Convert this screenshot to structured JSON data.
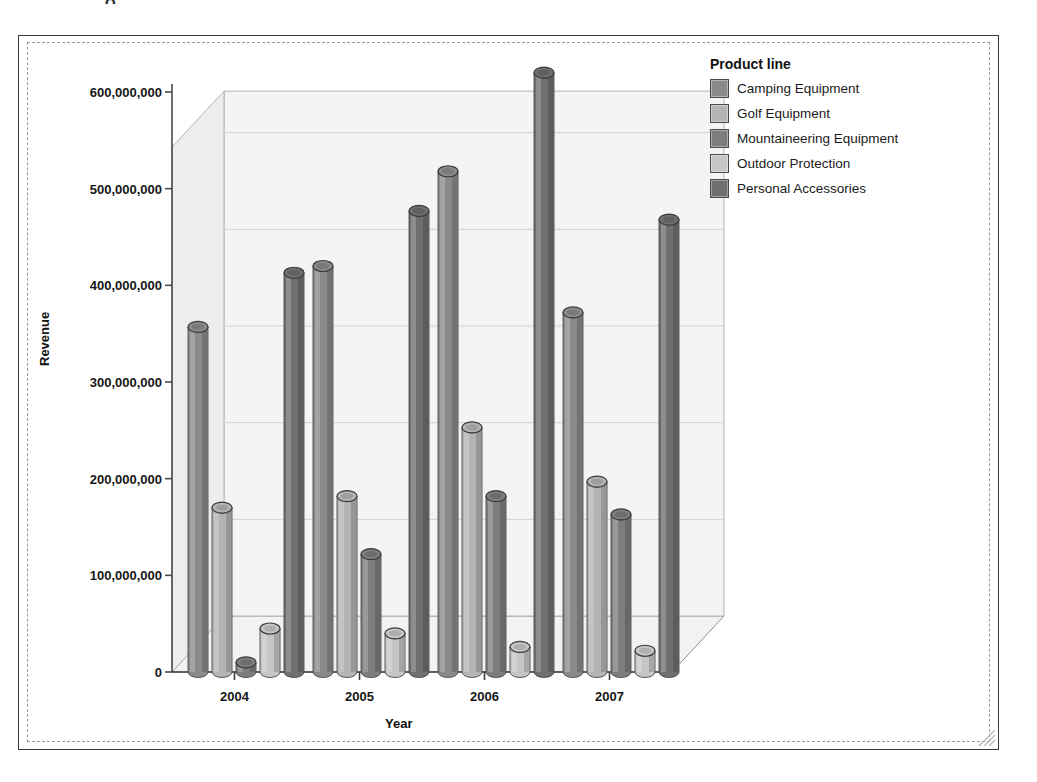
{
  "window": {
    "resize_grip": "resize-grip",
    "top_remnant": "g"
  },
  "legend": {
    "title": "Product line",
    "items": [
      {
        "label": "Camping Equipment",
        "color": "#8a8a8a"
      },
      {
        "label": "Golf Equipment",
        "color": "#b4b4b4"
      },
      {
        "label": "Mountaineering Equipment",
        "color": "#7d7d7d"
      },
      {
        "label": "Outdoor Protection",
        "color": "#c6c6c6"
      },
      {
        "label": "Personal Accessories",
        "color": "#6f6f6f"
      }
    ]
  },
  "chart_data": {
    "type": "bar",
    "title": "",
    "xlabel": "Year",
    "ylabel": "Revenue",
    "categories": [
      "2004",
      "2005",
      "2006",
      "2007"
    ],
    "ylim": [
      0,
      600000000
    ],
    "yticks": [
      0,
      100000000,
      200000000,
      300000000,
      400000000,
      500000000,
      600000000
    ],
    "ytick_labels": [
      "0",
      "100,000,000",
      "200,000,000",
      "300,000,000",
      "400,000,000",
      "500,000,000",
      "600,000,000"
    ],
    "grid": true,
    "legend_position": "right",
    "projection": "3d-cylinder",
    "series": [
      {
        "name": "Camping Equipment",
        "color": "#8a8a8a",
        "values": [
          357000000,
          420000000,
          518000000,
          372000000
        ]
      },
      {
        "name": "Golf Equipment",
        "color": "#b4b4b4",
        "values": [
          170000000,
          182000000,
          253000000,
          197000000
        ]
      },
      {
        "name": "Mountaineering Equipment",
        "color": "#7d7d7d",
        "values": [
          10000000,
          122000000,
          182000000,
          163000000
        ]
      },
      {
        "name": "Outdoor Protection",
        "color": "#c6c6c6",
        "values": [
          45000000,
          40000000,
          26000000,
          22000000
        ]
      },
      {
        "name": "Personal Accessories",
        "color": "#6f6f6f",
        "values": [
          413000000,
          477000000,
          620000000,
          468000000
        ]
      }
    ]
  }
}
